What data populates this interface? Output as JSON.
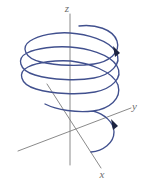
{
  "figure": {
    "background_color": "#ffffff",
    "axes": {
      "color": "#7d7d7d",
      "labels": {
        "z": "z",
        "y": "y",
        "x": "x"
      },
      "origin": {
        "x": 70,
        "y": 130
      },
      "z_axis": {
        "from": [
          70,
          14
        ],
        "to": [
          70,
          165
        ]
      },
      "y_axis": {
        "from": [
          18,
          151
        ],
        "to": [
          131,
          108
        ]
      },
      "x_axis": {
        "from": [
          47,
          84
        ],
        "to": [
          101,
          168
        ]
      }
    },
    "curve": {
      "name": "helix",
      "color": "#41508e",
      "turns": 2,
      "direction": "descending-clockwise-from-above",
      "ellipse_semi_major": 48,
      "ellipse_semi_minor": 15.5,
      "center_x": 70,
      "top_y": 26,
      "bottom_y": 152,
      "arrow_count": 2,
      "arrow_color": "#1c2340"
    }
  }
}
